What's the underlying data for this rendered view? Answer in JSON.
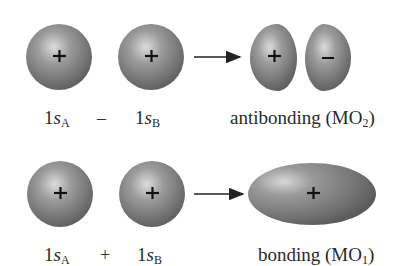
{
  "figure": {
    "rows": [
      {
        "name": "antibonding-row",
        "left_orbital": {
          "label_main": "1",
          "label_var": "s",
          "label_sub": "A",
          "sign": "+"
        },
        "operator": "–",
        "right_orbital": {
          "label_main": "1",
          "label_var": "s",
          "label_sub": "B",
          "sign": "+"
        },
        "result": {
          "lobes": [
            {
              "sign": "+"
            },
            {
              "sign": "–"
            }
          ],
          "label_text": "antibonding (MO",
          "label_sub": "2",
          "label_close": ")"
        }
      },
      {
        "name": "bonding-row",
        "left_orbital": {
          "label_main": "1",
          "label_var": "s",
          "label_sub": "A",
          "sign": "+"
        },
        "operator": "+",
        "right_orbital": {
          "label_main": "1",
          "label_var": "s",
          "label_sub": "B",
          "sign": "+"
        },
        "result": {
          "lobes": [
            {
              "sign": "+"
            }
          ],
          "label_text": "bonding (MO",
          "label_sub": "1",
          "label_close": ")"
        }
      }
    ],
    "colors": {
      "orbital_light": "#c9c9c9",
      "orbital_mid": "#8a8a8a",
      "orbital_dark": "#5a5a5a",
      "arrow": "#222222",
      "text": "#2a2a2a"
    }
  }
}
